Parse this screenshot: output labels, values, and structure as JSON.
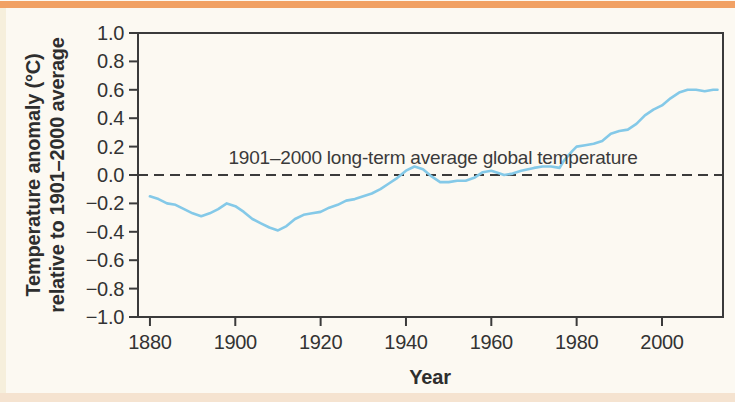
{
  "page": {
    "background_color": "#fcf9f2",
    "top_bar_color": "#f1a164",
    "bottom_strip_color": "#f5e3d0"
  },
  "chart_data": {
    "type": "line",
    "title": "",
    "xlabel": "Year",
    "ylabel_line1": "Temperature anomaly (°C)",
    "ylabel_line2": "relative to 1901–2000 average",
    "annotation": "1901–2000 long-term average global temperature",
    "x_ticks": [
      1880,
      1900,
      1920,
      1940,
      1960,
      1980,
      2000
    ],
    "y_ticks": [
      1.0,
      0.8,
      0.6,
      0.4,
      0.2,
      0.0,
      -0.2,
      -0.4,
      -0.6,
      -0.8,
      -1.0
    ],
    "y_tick_labels": [
      "1.0",
      "0.8",
      "0.6",
      "0.4",
      "0.2",
      "0.0",
      "−0.2",
      "−0.4",
      "−0.6",
      "−0.8",
      "−1.0"
    ],
    "xlim": [
      1877.2,
      2014.3
    ],
    "ylim": [
      -1.0,
      1.0
    ],
    "grid": false,
    "legend": false,
    "reference_line_y": 0.0,
    "line_color": "#84c9e8",
    "axis_color": "#3b3b3b",
    "series": [
      {
        "name": "Global annual temperature anomaly (smoothed)",
        "points": [
          [
            1880,
            -0.15
          ],
          [
            1882,
            -0.17
          ],
          [
            1884,
            -0.2
          ],
          [
            1886,
            -0.21
          ],
          [
            1888,
            -0.24
          ],
          [
            1890,
            -0.27
          ],
          [
            1892,
            -0.29
          ],
          [
            1894,
            -0.27
          ],
          [
            1896,
            -0.24
          ],
          [
            1898,
            -0.2
          ],
          [
            1900,
            -0.22
          ],
          [
            1902,
            -0.26
          ],
          [
            1904,
            -0.31
          ],
          [
            1906,
            -0.34
          ],
          [
            1908,
            -0.37
          ],
          [
            1910,
            -0.39
          ],
          [
            1912,
            -0.36
          ],
          [
            1914,
            -0.31
          ],
          [
            1916,
            -0.28
          ],
          [
            1918,
            -0.27
          ],
          [
            1920,
            -0.26
          ],
          [
            1922,
            -0.23
          ],
          [
            1924,
            -0.21
          ],
          [
            1926,
            -0.18
          ],
          [
            1928,
            -0.17
          ],
          [
            1930,
            -0.15
          ],
          [
            1932,
            -0.13
          ],
          [
            1934,
            -0.1
          ],
          [
            1936,
            -0.06
          ],
          [
            1938,
            -0.02
          ],
          [
            1940,
            0.03
          ],
          [
            1942,
            0.06
          ],
          [
            1944,
            0.04
          ],
          [
            1946,
            -0.01
          ],
          [
            1948,
            -0.05
          ],
          [
            1950,
            -0.05
          ],
          [
            1952,
            -0.04
          ],
          [
            1954,
            -0.04
          ],
          [
            1956,
            -0.02
          ],
          [
            1958,
            0.02
          ],
          [
            1960,
            0.03
          ],
          [
            1962,
            0.01
          ],
          [
            1963,
            0.0
          ],
          [
            1965,
            0.01
          ],
          [
            1967,
            0.03
          ],
          [
            1970,
            0.05
          ],
          [
            1972,
            0.06
          ],
          [
            1974,
            0.06
          ],
          [
            1976,
            0.05
          ],
          [
            1977,
            0.1
          ],
          [
            1979,
            0.17
          ],
          [
            1980,
            0.2
          ],
          [
            1982,
            0.21
          ],
          [
            1984,
            0.22
          ],
          [
            1986,
            0.24
          ],
          [
            1988,
            0.29
          ],
          [
            1990,
            0.31
          ],
          [
            1992,
            0.32
          ],
          [
            1994,
            0.36
          ],
          [
            1996,
            0.42
          ],
          [
            1998,
            0.46
          ],
          [
            2000,
            0.49
          ],
          [
            2002,
            0.54
          ],
          [
            2004,
            0.58
          ],
          [
            2006,
            0.6
          ],
          [
            2008,
            0.6
          ],
          [
            2010,
            0.59
          ],
          [
            2012,
            0.6
          ],
          [
            2013,
            0.6
          ]
        ]
      }
    ]
  }
}
